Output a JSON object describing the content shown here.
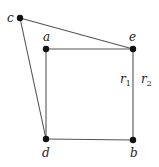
{
  "diagram": {
    "nodes": [
      {
        "id": "c",
        "label": "c"
      },
      {
        "id": "a",
        "label": "a"
      },
      {
        "id": "e",
        "label": "e"
      },
      {
        "id": "d",
        "label": "d"
      },
      {
        "id": "b",
        "label": "b"
      }
    ],
    "edges": [
      {
        "from": "c",
        "to": "e"
      },
      {
        "from": "c",
        "to": "d"
      },
      {
        "from": "a",
        "to": "e"
      },
      {
        "from": "a",
        "to": "d"
      },
      {
        "from": "e",
        "to": "b"
      },
      {
        "from": "d",
        "to": "b"
      }
    ],
    "annotations": [
      {
        "name": "r1",
        "base": "r",
        "sub": "1"
      },
      {
        "name": "r2",
        "base": "r",
        "sub": "2"
      }
    ]
  }
}
